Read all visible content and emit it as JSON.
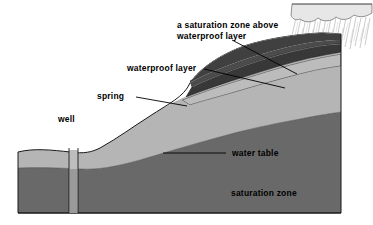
{
  "figure": {
    "type": "cross-section-diagram",
    "background_color": "#ffffff",
    "ink_color": "#000000"
  },
  "labels": {
    "perched_zone": "a saturation zone above\nwaterproof layer",
    "waterproof_layer": "waterproof layer",
    "spring": "spring",
    "well": "well",
    "water_table": "water table",
    "saturation_zone": "saturation zone"
  },
  "features": [
    {
      "name": "rain-cloud",
      "description": "cloud with rain streaks",
      "color": "#e8e8e8"
    },
    {
      "name": "unsaturated-zone",
      "description": "light speckled soil above water table",
      "color": "#c6c6c6"
    },
    {
      "name": "saturation-zone",
      "description": "dark speckled saturated soil",
      "color": "#8f8f8f"
    },
    {
      "name": "waterproof-layer",
      "description": "dark impermeable band in hillside",
      "color": "#5a5a5a"
    },
    {
      "name": "perched-saturation-zone",
      "description": "light band above waterproof layer",
      "color": "#cfcfcf"
    },
    {
      "name": "well-shaft",
      "description": "vertical well casing through soil",
      "color": "#bdbdbd"
    }
  ]
}
